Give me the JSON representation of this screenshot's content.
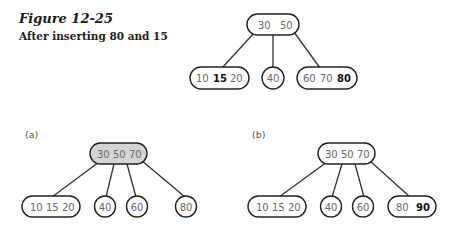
{
  "figure": {
    "title": "Figure 12-25",
    "caption": "After inserting 80 and 15"
  },
  "panels": {
    "a_label": "(a)",
    "b_label": "(b)"
  },
  "trees": {
    "top": {
      "root": {
        "keys": [
          "30",
          "50"
        ]
      },
      "children": [
        {
          "keys": [
            "10",
            "15",
            "20"
          ],
          "bold": [
            "15"
          ]
        },
        {
          "keys": [
            "40"
          ]
        },
        {
          "keys": [
            "60",
            "70",
            "80"
          ],
          "bold": [
            "80"
          ]
        }
      ]
    },
    "a": {
      "root": {
        "keys": [
          "30",
          "50",
          "70"
        ],
        "shaded": true
      },
      "children": [
        {
          "keys": [
            "10",
            "15",
            "20"
          ]
        },
        {
          "keys": [
            "40"
          ]
        },
        {
          "keys": [
            "60"
          ]
        },
        {
          "keys": [
            "80"
          ]
        }
      ]
    },
    "b": {
      "root": {
        "keys": [
          "30",
          "50",
          "70"
        ]
      },
      "children": [
        {
          "keys": [
            "10",
            "15",
            "20"
          ]
        },
        {
          "keys": [
            "40"
          ]
        },
        {
          "keys": [
            "60"
          ]
        },
        {
          "keys": [
            "80",
            "90"
          ],
          "bold": [
            "90"
          ]
        }
      ]
    }
  },
  "colors": {
    "node_stroke": "#222222",
    "shaded_fill": "#d4d4d4",
    "key_text": "#6a6a6a",
    "bold_key_text": "#111111"
  }
}
